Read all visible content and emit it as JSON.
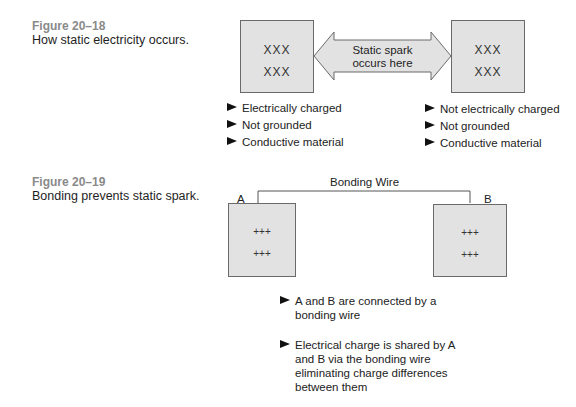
{
  "figure_18": {
    "number": "Figure 20–18",
    "caption": "How static electricity occurs.",
    "left_box": {
      "rows": [
        "XXX",
        "XXX"
      ]
    },
    "right_box": {
      "rows": [
        "XXX",
        "XXX"
      ]
    },
    "arrow_text_line1": "Static spark",
    "arrow_text_line2": "occurs here",
    "left_bullets": [
      "Electrically charged",
      "Not grounded",
      "Conductive material"
    ],
    "right_bullets": [
      "Not electrically charged",
      "Not grounded",
      "Conductive material"
    ]
  },
  "figure_19": {
    "number": "Figure 20–19",
    "caption": "Bonding prevents static spark.",
    "wire_label": "Bonding Wire",
    "box_a_label": "A",
    "box_b_label": "B",
    "box_a": {
      "rows": [
        "+++",
        "+++"
      ]
    },
    "box_b": {
      "rows": [
        "+++",
        "+++"
      ]
    },
    "bullets": [
      "A and B are connected by a bonding wire",
      "Electrical charge is shared by A and B via the bonding wire eliminating charge differences between them"
    ]
  },
  "colors": {
    "box_fill": "#e2e2e2",
    "box_border": "#6a6a6a",
    "figure_number": "#8a8a8a",
    "text": "#1e1e1e"
  }
}
